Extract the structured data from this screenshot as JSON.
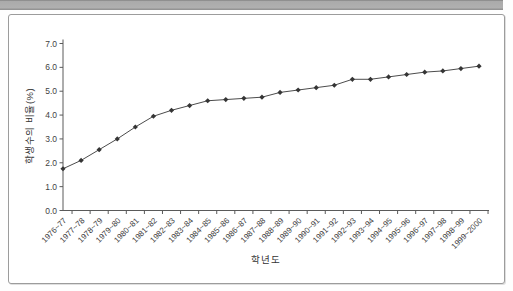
{
  "top_bar": {
    "color": "#ababab"
  },
  "panel": {
    "border_color": "#9c9c9c",
    "background": "#ffffff"
  },
  "chart_data": {
    "type": "line",
    "title": "",
    "xlabel": "학년도",
    "ylabel": "학생수의 비율(%)",
    "ylim": [
      0.0,
      7.0
    ],
    "ytick_labels": [
      "0.0",
      "1.0",
      "2.0",
      "3.0",
      "4.0",
      "5.0",
      "6.0",
      "7.0"
    ],
    "grid": false,
    "legend": "none",
    "line_color": "#4c4c4c",
    "marker": "diamond",
    "marker_color": "#353535",
    "axis_color": "#5a5a5a",
    "categories": [
      "1976~77",
      "1977~78",
      "1978~79",
      "1979~80",
      "1980~81",
      "1981~82",
      "1982~83",
      "1983~84",
      "1984~85",
      "1985~86",
      "1986~87",
      "1987~88",
      "1988~89",
      "1989~90",
      "1990~91",
      "1991~92",
      "1992~93",
      "1993~94",
      "1994~95",
      "1995~96",
      "1996~97",
      "1997~98",
      "1998~99",
      "1999~2000"
    ],
    "values": [
      1.75,
      2.1,
      2.55,
      3.0,
      3.5,
      3.95,
      4.2,
      4.4,
      4.6,
      4.65,
      4.7,
      4.75,
      4.95,
      5.05,
      5.15,
      5.25,
      5.5,
      5.5,
      5.6,
      5.7,
      5.8,
      5.85,
      5.95,
      6.05
    ]
  }
}
